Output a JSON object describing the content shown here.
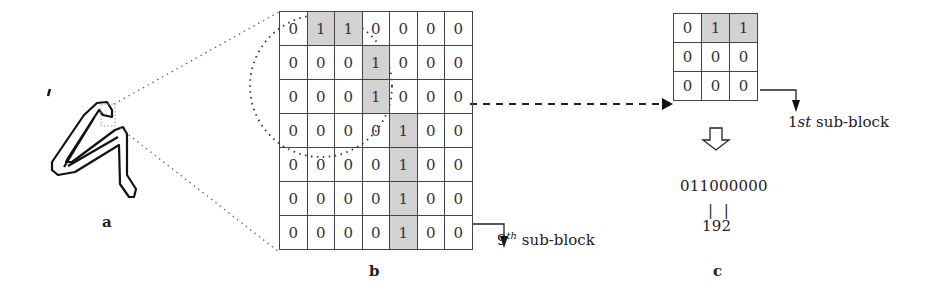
{
  "panels": {
    "a": {
      "label": "a"
    },
    "b": {
      "label": "b",
      "grid": [
        [
          0,
          1,
          1,
          0,
          0,
          0,
          0
        ],
        [
          0,
          0,
          0,
          1,
          0,
          0,
          0
        ],
        [
          0,
          0,
          0,
          1,
          0,
          0,
          0
        ],
        [
          0,
          0,
          0,
          0,
          1,
          0,
          0
        ],
        [
          0,
          0,
          0,
          0,
          1,
          0,
          0
        ],
        [
          0,
          0,
          0,
          0,
          1,
          0,
          0
        ],
        [
          0,
          0,
          0,
          0,
          1,
          0,
          0
        ]
      ],
      "sub_block_prefix": "9",
      "sub_block_sup": "th",
      "sub_block_suffix": " sub-block"
    },
    "c": {
      "label": "c",
      "grid": [
        [
          0,
          1,
          1
        ],
        [
          0,
          0,
          0
        ],
        [
          0,
          0,
          0
        ]
      ],
      "sub_block_prefix": "1",
      "sub_block_italic": "st",
      "sub_block_suffix": " sub-block",
      "binary_code": "011000000",
      "separator": "| |",
      "decimal_value": "192"
    }
  },
  "colors": {
    "cell_on": "#d2d2d2",
    "line": "#444444"
  }
}
